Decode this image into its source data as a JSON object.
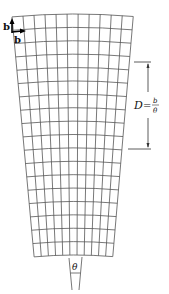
{
  "figure": {
    "type": "curved lattice with edge dislocation (wedge disclination diagram)",
    "labels": {
      "burgers_vertical": "b",
      "burgers_horizontal": "b",
      "distance_label": "D",
      "distance_numerator": "b",
      "distance_denominator": "θ",
      "equals": "=",
      "angle": "θ"
    },
    "grid": {
      "columns": 11,
      "rows": 18,
      "line_color": "#555555"
    }
  }
}
